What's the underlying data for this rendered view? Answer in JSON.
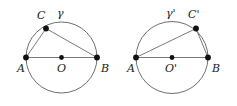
{
  "figure": {
    "type": "geometry-diagram",
    "background_color": "#ffffff",
    "stroke_color": "#4a4a4a",
    "point_color": "#111111",
    "panels": [
      {
        "id": "left-panel",
        "circle_label": "γ",
        "circle": {
          "cx": 61.5,
          "cy": 57.5,
          "r": 35.5
        },
        "points": [
          {
            "name": "A",
            "label": "A",
            "x": 26.0,
            "y": 57.5,
            "label_x": 17,
            "label_y": 63
          },
          {
            "name": "O",
            "label": "O",
            "x": 61.5,
            "y": 57.5,
            "label_x": 57,
            "label_y": 63
          },
          {
            "name": "B",
            "label": "B",
            "x": 97.0,
            "y": 57.5,
            "label_x": 101,
            "label_y": 63
          },
          {
            "name": "C",
            "label": "C",
            "x": 46.0,
            "y": 28.5,
            "label_x": 37,
            "label_y": 10
          }
        ],
        "circle_label_x": 57,
        "circle_label_y": 8,
        "segments": [
          {
            "from": "A",
            "to": "B",
            "kind": "diameter"
          },
          {
            "from": "A",
            "to": "C",
            "kind": "chord"
          },
          {
            "from": "C",
            "to": "B",
            "kind": "chord"
          }
        ]
      },
      {
        "id": "right-panel",
        "circle_label": "γ'",
        "circle": {
          "cx": 172.0,
          "cy": 57.5,
          "r": 36.0
        },
        "points": [
          {
            "name": "A",
            "label": "A",
            "x": 136.0,
            "y": 57.5,
            "label_x": 127,
            "label_y": 63
          },
          {
            "name": "O'",
            "label": "O'",
            "x": 172.0,
            "y": 57.5,
            "label_x": 165,
            "label_y": 63
          },
          {
            "name": "B",
            "label": "B",
            "x": 208.0,
            "y": 57.5,
            "label_x": 212,
            "label_y": 63
          },
          {
            "name": "C'",
            "label": "C'",
            "x": 196.0,
            "y": 28.5,
            "label_x": 188,
            "label_y": 9
          }
        ],
        "circle_label_x": 166,
        "circle_label_y": 8,
        "segments": [
          {
            "from": "A",
            "to": "B",
            "kind": "diameter"
          },
          {
            "from": "A",
            "to": "C'",
            "kind": "chord"
          },
          {
            "from": "C'",
            "to": "B",
            "kind": "chord"
          }
        ]
      }
    ]
  }
}
